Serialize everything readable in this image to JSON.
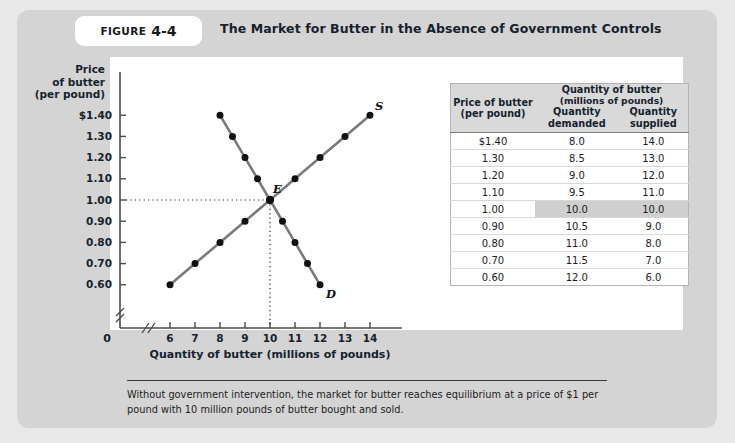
{
  "figure": {
    "badge_word": "FIGURE",
    "badge_number": "4-4",
    "title": "The Market for Butter in the Absence of Government Controls",
    "caption": "Without government intervention, the market for butter reaches equilibrium at a price of $1 per pound with 10 million pounds of butter bought and sold."
  },
  "table": {
    "span_header": "Quantity of butter",
    "span_header_sub": "(millions of pounds)",
    "col_price_1": "Price of butter",
    "col_price_2": "(per pound)",
    "col_demanded_1": "Quantity",
    "col_demanded_2": "demanded",
    "col_supplied_1": "Quantity",
    "col_supplied_2": "supplied",
    "rows": [
      {
        "price": "$1.40",
        "demanded": "8.0",
        "supplied": "14.0",
        "highlight": false
      },
      {
        "price": "1.30",
        "demanded": "8.5",
        "supplied": "13.0",
        "highlight": false
      },
      {
        "price": "1.20",
        "demanded": "9.0",
        "supplied": "12.0",
        "highlight": false
      },
      {
        "price": "1.10",
        "demanded": "9.5",
        "supplied": "11.0",
        "highlight": false
      },
      {
        "price": "1.00",
        "demanded": "10.0",
        "supplied": "10.0",
        "highlight": true
      },
      {
        "price": "0.90",
        "demanded": "10.5",
        "supplied": "9.0",
        "highlight": false
      },
      {
        "price": "0.80",
        "demanded": "11.0",
        "supplied": "8.0",
        "highlight": false
      },
      {
        "price": "0.70",
        "demanded": "11.5",
        "supplied": "7.0",
        "highlight": false
      },
      {
        "price": "0.60",
        "demanded": "12.0",
        "supplied": "6.0",
        "highlight": false
      }
    ],
    "highlight_color": "#cfcfcf"
  },
  "chart_data": {
    "type": "line",
    "title": "The Market for Butter in the Absence of Government Controls",
    "xlabel": "Quantity of butter (millions of pounds)",
    "ylabel": "Price of butter (per pound)",
    "ylabel_lines": [
      "Price",
      "of butter",
      "(per pound)"
    ],
    "xlim": [
      6,
      14
    ],
    "ylim": [
      0.6,
      1.4
    ],
    "x_ticks": [
      "6",
      "7",
      "8",
      "9",
      "10",
      "11",
      "12",
      "13",
      "14"
    ],
    "x_tick_values": [
      6,
      7,
      8,
      9,
      10,
      11,
      12,
      13,
      14
    ],
    "y_ticks": [
      "$1.40",
      "1.30",
      "1.20",
      "1.10",
      "1.00",
      "0.90",
      "0.80",
      "0.70",
      "0.60"
    ],
    "y_tick_values": [
      1.4,
      1.3,
      1.2,
      1.1,
      1.0,
      0.9,
      0.8,
      0.7,
      0.6
    ],
    "origin_label": "0",
    "axis_break": true,
    "grid": false,
    "legend": "none",
    "series": [
      {
        "name": "Demand",
        "label": "D",
        "color": "#7a7a7a",
        "marker_color": "#111111",
        "points": [
          {
            "x": 8,
            "y": 1.4
          },
          {
            "x": 8.5,
            "y": 1.3
          },
          {
            "x": 9,
            "y": 1.2
          },
          {
            "x": 9.5,
            "y": 1.1
          },
          {
            "x": 10,
            "y": 1.0
          },
          {
            "x": 10.5,
            "y": 0.9
          },
          {
            "x": 11,
            "y": 0.8
          },
          {
            "x": 11.5,
            "y": 0.7
          },
          {
            "x": 12,
            "y": 0.6
          }
        ]
      },
      {
        "name": "Supply",
        "label": "S",
        "color": "#7a7a7a",
        "marker_color": "#111111",
        "points": [
          {
            "x": 6,
            "y": 0.6
          },
          {
            "x": 7,
            "y": 0.7
          },
          {
            "x": 8,
            "y": 0.8
          },
          {
            "x": 9,
            "y": 0.9
          },
          {
            "x": 10,
            "y": 1.0
          },
          {
            "x": 11,
            "y": 1.1
          },
          {
            "x": 12,
            "y": 1.2
          },
          {
            "x": 13,
            "y": 1.3
          },
          {
            "x": 14,
            "y": 1.4
          }
        ]
      }
    ],
    "annotations": [
      {
        "label": "E",
        "x": 10,
        "y": 1.0,
        "note": "equilibrium point"
      }
    ],
    "guide_lines": [
      {
        "orientation": "horizontal",
        "y": 1.0,
        "style": "dotted"
      },
      {
        "orientation": "vertical",
        "x": 10,
        "style": "dotted"
      }
    ]
  }
}
